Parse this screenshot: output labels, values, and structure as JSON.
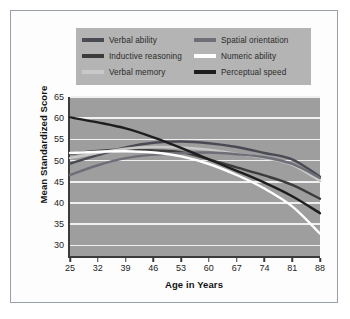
{
  "chart_data": {
    "type": "line",
    "title": "",
    "xlabel": "Age in Years",
    "ylabel": "Mean Standardized Score",
    "x": [
      25,
      32,
      39,
      46,
      53,
      60,
      67,
      74,
      81,
      88
    ],
    "xtick_labels": [
      "25",
      "32",
      "39",
      "46",
      "53",
      "60",
      "67",
      "74",
      "81",
      "88"
    ],
    "ytick_labels": [
      "65",
      "60",
      "55",
      "50",
      "45",
      "40",
      "35",
      "30"
    ],
    "yticks": [
      65,
      60,
      55,
      50,
      45,
      40,
      35,
      30
    ],
    "xlim": [
      25,
      88
    ],
    "ylim": [
      27.5,
      65
    ],
    "grid": true,
    "legend_position": "above-plot",
    "series": [
      {
        "name": "Verbal ability",
        "color": "#4a4a54",
        "values": [
          49.3,
          51.3,
          53.1,
          54.2,
          54.5,
          54.1,
          53.2,
          51.8,
          50.3,
          46.2
        ]
      },
      {
        "name": "Inductive reasoning",
        "color": "#3c3c3c",
        "values": [
          51.6,
          52.3,
          52.6,
          52.4,
          52.0,
          50.3,
          48.4,
          46.5,
          44.3,
          41.0
        ]
      },
      {
        "name": "Verbal memory",
        "color": "#c9c9c9",
        "values": [
          50.6,
          51.8,
          52.8,
          53.2,
          53.1,
          52.6,
          51.6,
          50.6,
          49.0,
          45.2
        ]
      },
      {
        "name": "Spatial orientation",
        "color": "#6e6e78",
        "values": [
          46.6,
          48.9,
          50.6,
          51.4,
          51.8,
          51.9,
          51.5,
          50.8,
          49.2,
          45.9
        ]
      },
      {
        "name": "Numeric ability",
        "color": "#ffffff",
        "values": [
          51.8,
          52.1,
          52.2,
          51.9,
          51.0,
          49.2,
          46.6,
          43.4,
          39.2,
          32.8
        ]
      },
      {
        "name": "Perceptual speed",
        "color": "#1e1e1e",
        "values": [
          60.2,
          59.0,
          57.6,
          55.5,
          53.0,
          50.3,
          47.6,
          44.8,
          41.6,
          37.6
        ]
      }
    ]
  },
  "legend": {
    "entries": [
      {
        "label": "Verbal ability",
        "color": "#4a4a54"
      },
      {
        "label": "Spatial orientation",
        "color": "#6e6e78"
      },
      {
        "label": "Inductive reasoning",
        "color": "#3c3c3c"
      },
      {
        "label": "Numeric ability",
        "color": "#ffffff"
      },
      {
        "label": "Verbal memory",
        "color": "#c9c9c9"
      },
      {
        "label": "Perceptual speed",
        "color": "#1e1e1e"
      }
    ]
  },
  "style": {
    "plot_background": "#9e9e9e",
    "figure_background": "#fdfdfd",
    "legend_background": "#b4b4b4",
    "gridline_color": "#f0f0f0",
    "axis_color": "#3b3b3b",
    "frame_border": "#9aa0ab"
  }
}
